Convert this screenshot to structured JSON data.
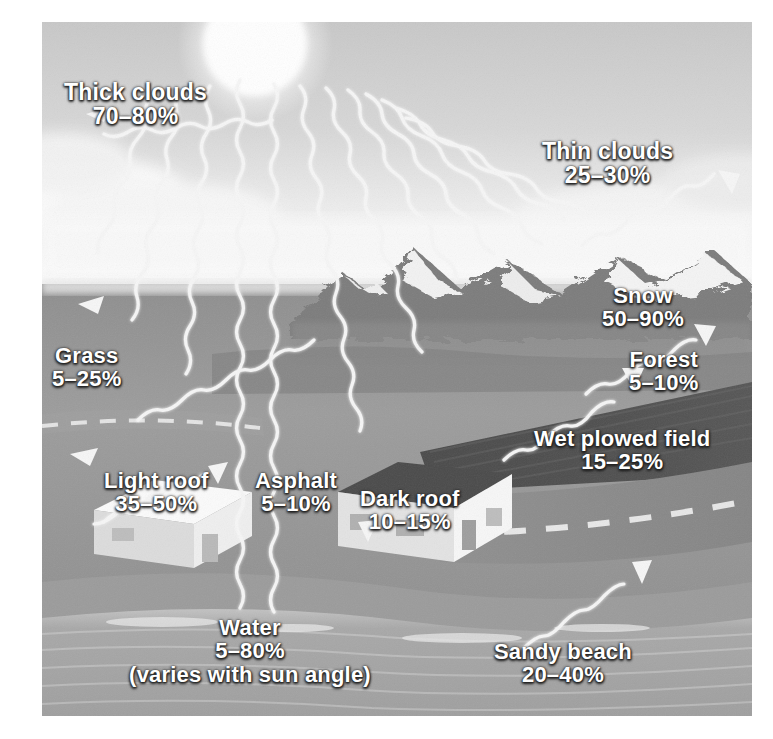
{
  "figure": {
    "type": "illustration",
    "palette": {
      "sky": "#d8d8d8",
      "sun": "#ffffff",
      "cloud": "#f2f2f2",
      "ground": "#9a9a9a",
      "field": "#4f4f4f",
      "road": "#8a8a8a",
      "water": "#a6a6a6",
      "ray": "#f4f4f4",
      "label_text": "#ffffff",
      "page_background": "#ffffff"
    }
  },
  "scene": {
    "sun_name": "sun",
    "ray_name": "solar-ray",
    "horizon_name": "horizon"
  },
  "labels": [
    {
      "id": "thick-clouds",
      "title": "Thick clouds",
      "value": "70–80%",
      "note": ""
    },
    {
      "id": "thin-clouds",
      "title": "Thin clouds",
      "value": "25–30%",
      "note": ""
    },
    {
      "id": "snow",
      "title": "Snow",
      "value": "50–90%",
      "note": ""
    },
    {
      "id": "forest",
      "title": "Forest",
      "value": "5–10%",
      "note": ""
    },
    {
      "id": "grass",
      "title": "Grass",
      "value": "5–25%",
      "note": ""
    },
    {
      "id": "wet-plowed-field",
      "title": "Wet plowed field",
      "value": "15–25%",
      "note": ""
    },
    {
      "id": "light-roof",
      "title": "Light roof",
      "value": "35–50%",
      "note": ""
    },
    {
      "id": "asphalt",
      "title": "Asphalt",
      "value": "5–10%",
      "note": ""
    },
    {
      "id": "dark-roof",
      "title": "Dark roof",
      "value": "10–15%",
      "note": ""
    },
    {
      "id": "water",
      "title": "Water",
      "value": "5–80%",
      "note": "(varies with sun angle)"
    },
    {
      "id": "sandy-beach",
      "title": "Sandy beach",
      "value": "20–40%",
      "note": ""
    }
  ]
}
